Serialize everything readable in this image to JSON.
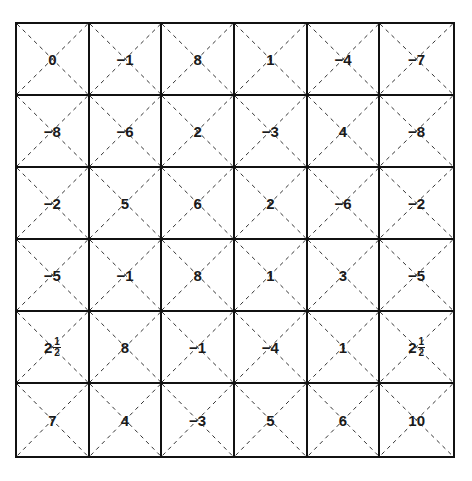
{
  "puzzle": {
    "rows": 6,
    "cols": 6,
    "line_color": "#111111",
    "grid": [
      [
        {
          "whole": "0"
        },
        {
          "whole": "−1"
        },
        {
          "whole": "8"
        },
        {
          "whole": "1"
        },
        {
          "whole": "−4"
        },
        {
          "whole": "−7"
        }
      ],
      [
        {
          "whole": "−8"
        },
        {
          "whole": "−6"
        },
        {
          "whole": "2"
        },
        {
          "whole": "−3"
        },
        {
          "whole": "4"
        },
        {
          "whole": "−8"
        }
      ],
      [
        {
          "whole": "−2"
        },
        {
          "whole": "5"
        },
        {
          "whole": "6"
        },
        {
          "whole": "2"
        },
        {
          "whole": "−6"
        },
        {
          "whole": "−2"
        }
      ],
      [
        {
          "whole": "−5"
        },
        {
          "whole": "−1"
        },
        {
          "whole": "8"
        },
        {
          "whole": "1"
        },
        {
          "whole": "3"
        },
        {
          "whole": "−5"
        }
      ],
      [
        {
          "whole": "2",
          "num": "1",
          "den": "2"
        },
        {
          "whole": "8"
        },
        {
          "whole": "−1"
        },
        {
          "whole": "−4"
        },
        {
          "whole": "1"
        },
        {
          "whole": "2",
          "num": "1",
          "den": "2"
        }
      ],
      [
        {
          "whole": "7"
        },
        {
          "whole": "4"
        },
        {
          "whole": "−3"
        },
        {
          "whole": "5"
        },
        {
          "whole": "6"
        },
        {
          "whole": "10"
        }
      ]
    ]
  }
}
